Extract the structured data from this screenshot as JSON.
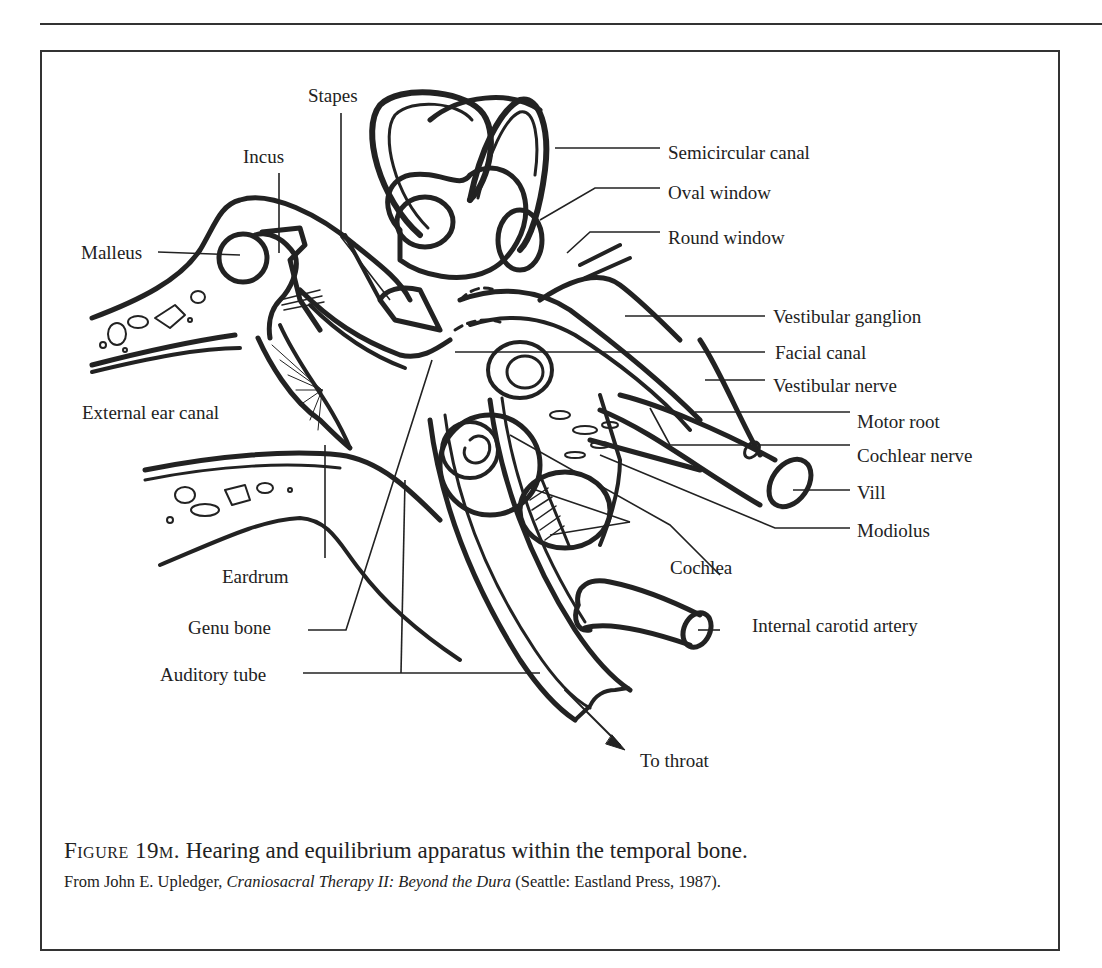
{
  "page": {
    "running_header": ""
  },
  "figure": {
    "labels": {
      "stapes": "Stapes",
      "incus": "Incus",
      "malleus": "Malleus",
      "semicircular_canal": "Semicircular canal",
      "oval_window": "Oval window",
      "round_window": "Round window",
      "vestibular_ganglion": "Vestibular ganglion",
      "facial_canal": "Facial canal",
      "vestibular_nerve": "Vestibular nerve",
      "motor_root": "Motor root",
      "cochlear_nerve": "Cochlear nerve",
      "vill": "Vill",
      "modiolus": "Modiolus",
      "cochlea": "Cochlea",
      "internal_carotid_artery": "Internal carotid artery",
      "to_throat": "To throat",
      "external_ear_canal": "External ear canal",
      "eardrum": "Eardrum",
      "genu_bone": "Genu bone",
      "auditory_tube": "Auditory tube"
    },
    "caption": {
      "number": "Figure 19m.",
      "text": " Hearing and equilibrium apparatus within the temporal bone."
    },
    "source": {
      "prefix": "From John E. Upledger, ",
      "title": "Craniosacral Therapy II: Beyond the Dura",
      "suffix": " (Seattle: Eastland Press, 1987)."
    }
  },
  "colors": {
    "ink": "#222222",
    "paper": "#ffffff"
  }
}
